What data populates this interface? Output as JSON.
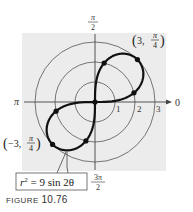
{
  "figure": {
    "caption_word": "FIGURE",
    "caption_number": "10.76",
    "equation_label": {
      "lhs": "r",
      "exponent": "2",
      "rhs": " = 9 sin 2θ"
    },
    "axis_labels": {
      "right": "0",
      "left": "π",
      "top_num": "π",
      "top_den": "2",
      "bottom_num": "3π",
      "bottom_den": "2"
    },
    "ring_labels": [
      "1",
      "2",
      "3"
    ],
    "point_labels": {
      "upper": {
        "r": "3",
        "theta_num": "π",
        "theta_den": "4",
        "text": "(3, π/4)"
      },
      "lower": {
        "r": "−3",
        "theta_num": "π",
        "theta_den": "4",
        "text": "(−3, π/4)"
      }
    },
    "colors": {
      "background_panel": "#ececec",
      "grid": "#555555",
      "curve": "#111111",
      "text": "#222222"
    }
  },
  "chart_data": {
    "type": "polar-curve",
    "equation": "r^2 = 9 sin 2θ",
    "rings": [
      1,
      2,
      3
    ],
    "axis_angles": [
      "0",
      "π/2",
      "π",
      "3π/2"
    ],
    "labeled_points": [
      {
        "r": 3,
        "theta": "π/4",
        "label": "(3, π/4)"
      },
      {
        "r": -3,
        "theta": "π/4",
        "label": "(−3, π/4)"
      }
    ],
    "marked_points": [
      {
        "r": 0,
        "theta_deg": 0
      },
      {
        "r": 3,
        "theta_deg": 45
      },
      {
        "r": 2,
        "theta_deg": 13.2
      },
      {
        "r": 2,
        "theta_deg": 76.8
      },
      {
        "r": 3,
        "theta_deg": 225
      },
      {
        "r": 2,
        "theta_deg": 193.2
      },
      {
        "r": 2,
        "theta_deg": 256.8
      }
    ],
    "rmax": 3
  }
}
